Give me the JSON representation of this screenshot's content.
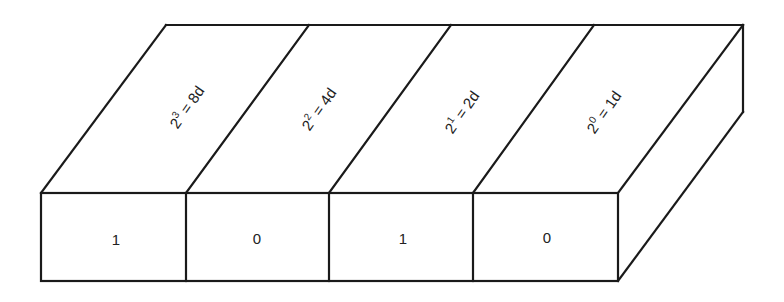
{
  "diagram": {
    "columns": [
      {
        "base": "2",
        "exponent": "3",
        "equals": " = ",
        "value": "8d",
        "bit": "1"
      },
      {
        "base": "2",
        "exponent": "2",
        "equals": " = ",
        "value": "4d",
        "bit": "0"
      },
      {
        "base": "2",
        "exponent": "1",
        "equals": " = ",
        "value": "2d",
        "bit": "1"
      },
      {
        "base": "2",
        "exponent": "0",
        "equals": " = ",
        "value": "1d",
        "bit": "0"
      }
    ],
    "colors": {
      "stroke": "#1a1a1a",
      "text": "#222222",
      "background": "#ffffff"
    }
  }
}
